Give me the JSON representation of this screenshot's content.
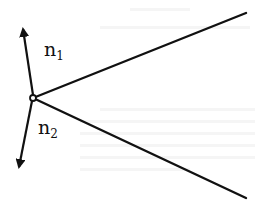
{
  "figure": {
    "type": "vertex with two edges and normal vectors",
    "stroke_color": "#111111",
    "background": "#ffffff",
    "vertex": {
      "x": 33,
      "y": 98,
      "r": 3
    },
    "edges": [
      {
        "name": "upper-edge",
        "x2": 246,
        "y2": 13
      },
      {
        "name": "lower-edge",
        "x2": 246,
        "y2": 198
      }
    ],
    "normals": [
      {
        "name": "n1",
        "base": "n",
        "sub": "1",
        "tip_x": 23,
        "tip_y": 29,
        "label_x": 44,
        "label_y": 43
      },
      {
        "name": "n2",
        "base": "n",
        "sub": "2",
        "tip_x": 19,
        "tip_y": 167,
        "label_x": 38,
        "label_y": 121
      }
    ]
  }
}
